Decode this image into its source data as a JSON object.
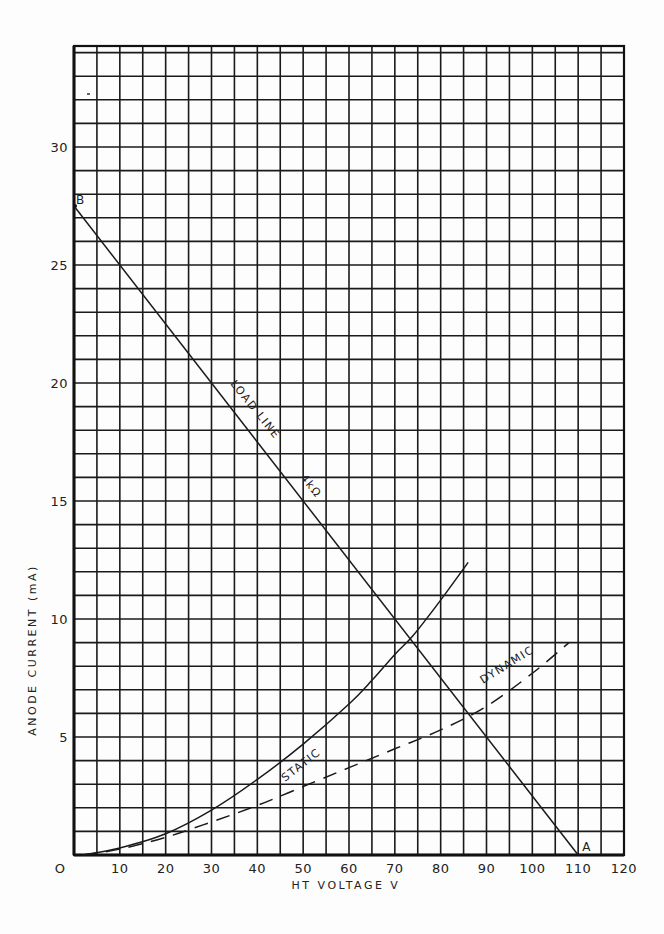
{
  "chart_data": {
    "type": "line",
    "title": "",
    "xlabel": "HT VOLTAGE V",
    "ylabel": "ANODE CURRENT (mA)",
    "xlim": [
      0,
      120
    ],
    "ylim": [
      0,
      34
    ],
    "grid": true,
    "x_ticks": [
      0,
      10,
      20,
      30,
      40,
      50,
      60,
      70,
      80,
      90,
      100,
      110,
      120
    ],
    "x_tick_labels": [
      "O",
      "10",
      "20",
      "30",
      "40",
      "50",
      "60",
      "70",
      "80",
      "90",
      "100",
      "110",
      "120"
    ],
    "y_ticks": [
      5,
      10,
      15,
      20,
      25,
      30
    ],
    "y_tick_labels": [
      "5",
      "10",
      "15",
      "20",
      "25",
      "30"
    ],
    "x_minor_step": 5,
    "y_minor_step": 1,
    "series": [
      {
        "name": "LOAD LINE 4kΩ",
        "style": "solid",
        "x": [
          0,
          110
        ],
        "y": [
          27.5,
          0
        ],
        "labels": [
          "LOAD LINE",
          "4kΩ"
        ]
      },
      {
        "name": "STATIC",
        "style": "solid",
        "x": [
          2,
          10,
          20,
          30,
          40,
          50,
          60,
          65,
          70,
          74,
          80,
          86
        ],
        "y": [
          0,
          0.3,
          0.9,
          1.9,
          3.2,
          4.7,
          6.4,
          7.4,
          8.5,
          9.3,
          10.8,
          12.4
        ]
      },
      {
        "name": "DYNAMIC",
        "style": "dashed",
        "x": [
          2,
          10,
          20,
          30,
          40,
          50,
          60,
          70,
          80,
          90,
          100,
          108
        ],
        "y": [
          0,
          0.25,
          0.75,
          1.4,
          2.1,
          2.9,
          3.7,
          4.5,
          5.3,
          6.3,
          7.7,
          9.0
        ]
      }
    ],
    "annotations": [
      {
        "text": "A",
        "x": 110,
        "y": 0
      },
      {
        "text": "B",
        "x": 0,
        "y": 27.5
      }
    ]
  }
}
